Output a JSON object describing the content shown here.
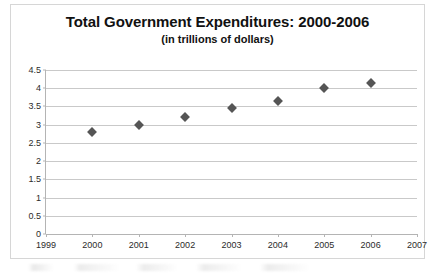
{
  "chart_data": {
    "type": "scatter",
    "title": "Total Government Expenditures:  2000-2006",
    "subtitle": "(in trillions of dollars)",
    "xlabel": "",
    "ylabel": "",
    "x": [
      2000,
      2001,
      2002,
      2003,
      2004,
      2005,
      2006
    ],
    "values": [
      2.8,
      3.0,
      3.2,
      3.45,
      3.65,
      4.0,
      4.15
    ],
    "categories": [
      "2000",
      "2001",
      "2002",
      "2003",
      "2004",
      "2005",
      "2006"
    ],
    "xlim": [
      1999,
      2007
    ],
    "ylim": [
      0,
      4.5
    ],
    "x_tick_labels": [
      "1999",
      "2000",
      "2001",
      "2002",
      "2003",
      "2004",
      "2005",
      "2006",
      "2007"
    ],
    "y_tick_labels": [
      "4.5",
      "4",
      "3.5",
      "3",
      "2.5",
      "2",
      "1.5",
      "1",
      "0.5",
      "0"
    ],
    "y_tick_values": [
      4.5,
      4,
      3.5,
      3,
      2.5,
      2,
      1.5,
      1,
      0.5,
      0
    ],
    "grid": "horizontal",
    "legend": "none",
    "marker": "diamond",
    "marker_color": "#555555",
    "gridline_color": "#c9c9c9",
    "axis_color": "#b4b4b4",
    "background_color": "#ffffff",
    "border_color": "#d6d6d6",
    "text_color": "#111111"
  }
}
